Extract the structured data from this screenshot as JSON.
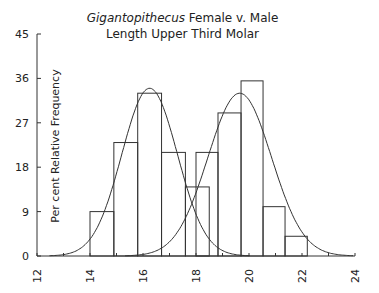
{
  "chart_data": {
    "type": "bar",
    "title_italic": "Gigantopithecus",
    "title_rest": " Female v. Male",
    "subtitle": "Length Upper Third Molar",
    "xlabel": "",
    "ylabel": "Per cent Relative Frequency",
    "xlim": [
      12,
      24
    ],
    "ylim": [
      0,
      45
    ],
    "x_ticks": [
      12,
      14,
      16,
      18,
      20,
      22,
      24
    ],
    "y_ticks": [
      0,
      9,
      18,
      27,
      36,
      45
    ],
    "grid": false,
    "legend": null,
    "series": [
      {
        "name": "Female",
        "bins": [
          {
            "x0": 14.0,
            "x1": 14.9,
            "value": 9
          },
          {
            "x0": 14.9,
            "x1": 15.8,
            "value": 23
          },
          {
            "x0": 15.8,
            "x1": 16.7,
            "value": 33
          },
          {
            "x0": 16.7,
            "x1": 17.6,
            "value": 21
          },
          {
            "x0": 17.6,
            "x1": 18.5,
            "value": 14
          }
        ],
        "normal_curve": {
          "mean": 16.25,
          "peak": 34,
          "sd": 1.05
        }
      },
      {
        "name": "Male",
        "bins": [
          {
            "x0": 18.0,
            "x1": 18.83,
            "value": 21
          },
          {
            "x0": 18.83,
            "x1": 19.7,
            "value": 29
          },
          {
            "x0": 19.7,
            "x1": 20.53,
            "value": 35.5
          },
          {
            "x0": 20.53,
            "x1": 21.36,
            "value": 10
          },
          {
            "x0": 21.36,
            "x1": 22.2,
            "value": 4
          }
        ],
        "normal_curve": {
          "mean": 19.65,
          "peak": 33,
          "sd": 1.2
        }
      }
    ]
  },
  "colors": {
    "line": "#333333",
    "text": "#222222",
    "background": "#ffffff"
  }
}
